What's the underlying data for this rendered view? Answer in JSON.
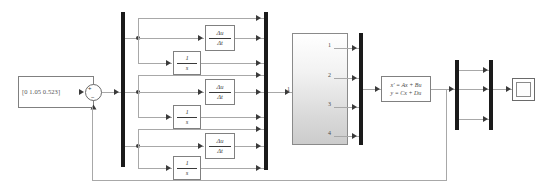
{
  "diagram": {
    "source_block": {
      "name": "initial-condition-vector",
      "value": "[0 1.05 0.523]"
    },
    "sum_junction": {
      "name": "summing-junction",
      "plus": "+",
      "minus": "−"
    },
    "branches": [
      {
        "index": 1,
        "passthrough_label": "",
        "derivative": {
          "numerator": "Δu",
          "denominator": "Δt"
        },
        "integrator": {
          "numerator": "1",
          "denominator": "s"
        }
      },
      {
        "index": 2,
        "passthrough_label": "",
        "derivative": {
          "numerator": "Δu",
          "denominator": "Δt"
        },
        "integrator": {
          "numerator": "1",
          "denominator": "s"
        }
      },
      {
        "index": 3,
        "passthrough_label": "",
        "derivative": {
          "numerator": "Δu",
          "denominator": "Δt"
        },
        "integrator": {
          "numerator": "1",
          "denominator": "s"
        }
      }
    ],
    "matrix_block": {
      "name": "matrix-gain-block",
      "input_port_label": "1",
      "output_port_labels": [
        "1",
        "2",
        "3",
        "4"
      ]
    },
    "state_space": {
      "name": "state-space-block",
      "line1": "x′ = Ax + Bu",
      "line2": "y = Cx + Du"
    },
    "scope": {
      "name": "scope-block",
      "label": ""
    },
    "buses": [
      {
        "name": "demux-bus-input",
        "ports": 9
      },
      {
        "name": "mux-bus-branches",
        "ports": 9
      },
      {
        "name": "mux-bus-matrix-out",
        "ports": 4
      },
      {
        "name": "demux-bus-state-out",
        "ports": 3
      },
      {
        "name": "mux-bus-scope-in",
        "ports": 3
      }
    ],
    "colors": {
      "wire": "#a8a8a8",
      "bus": "#1a1a1a",
      "block_border": "#808080",
      "text": "#3a3a3a",
      "background": "#ffffff"
    }
  }
}
